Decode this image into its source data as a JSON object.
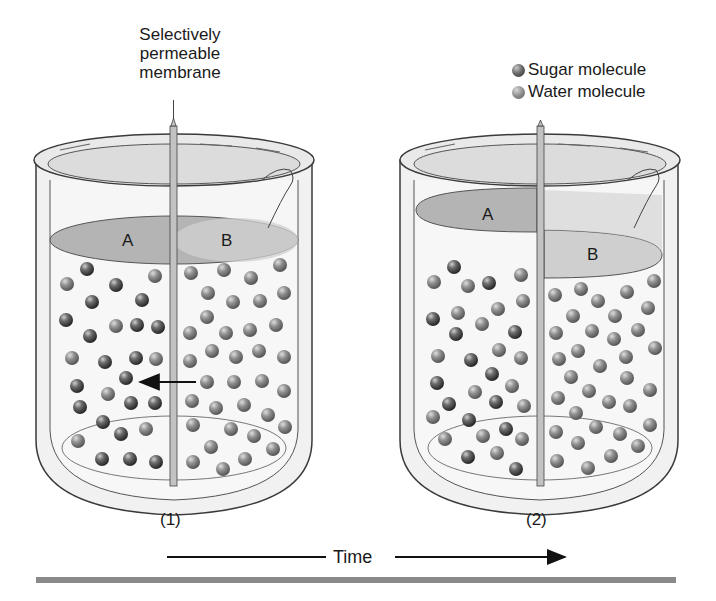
{
  "diagram": {
    "membrane_label_line1": "Selectively",
    "membrane_label_line2": "permeable",
    "membrane_label_line3": "membrane",
    "legend": {
      "sugar": "Sugar molecule",
      "water": "Water molecule"
    },
    "beakers": [
      {
        "caption": "(1)",
        "compartments": [
          {
            "label": "A"
          },
          {
            "label": "B"
          }
        ],
        "note": "Equal liquid levels; arrow shows water moving from B to A"
      },
      {
        "caption": "(2)",
        "compartments": [
          {
            "label": "A"
          },
          {
            "label": "B"
          }
        ],
        "note": "Level in A higher than B after osmosis"
      }
    ],
    "time_label": "Time",
    "colors": {
      "liquid_shade": "#b4b4b4",
      "glass": "#e6e6e6",
      "outline": "#3a3a3a",
      "molecule_dark": "#3a3a3a",
      "molecule_light": "#8a8a8a",
      "rule": "#8a8a8a"
    }
  }
}
